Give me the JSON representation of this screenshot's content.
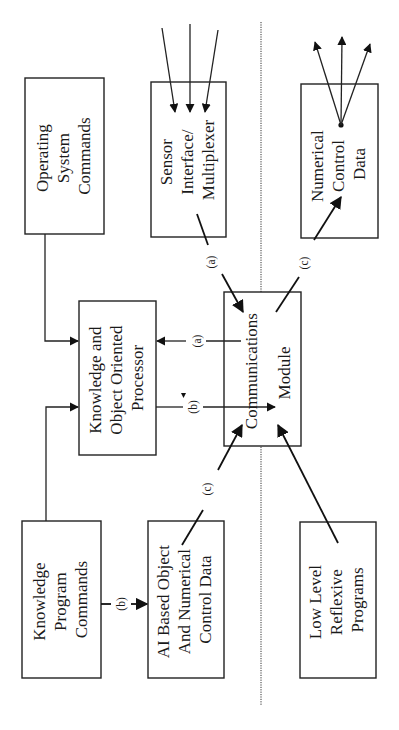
{
  "diagram": {
    "orientation": "rotated-90-ccw",
    "separator": "dotted-vertical-line",
    "boxes": {
      "operating_system": {
        "lines": [
          "Operating",
          "System",
          "Commands"
        ]
      },
      "sensor_interface": {
        "lines": [
          "Sensor",
          "Interface/",
          "Multiplexer"
        ]
      },
      "numerical_control": {
        "lines": [
          "Numerical",
          "Control",
          "Data"
        ]
      },
      "knowledge_processor": {
        "lines": [
          "Knowledge and",
          "Object Oriented",
          "Processor"
        ]
      },
      "communications": {
        "lines": [
          "Communications",
          "Module"
        ]
      },
      "knowledge_program": {
        "lines": [
          "Knowledge",
          "Program",
          "Commands"
        ]
      },
      "ai_based": {
        "lines": [
          "AI Based Object",
          "And Numerical",
          "Control Data"
        ]
      },
      "low_level": {
        "lines": [
          "Low Level",
          "Reflexive",
          "Programs"
        ]
      }
    },
    "connection_labels": {
      "sensor_to_comm": "(a)",
      "comm_to_processor": "(a)",
      "processor_to_comm": "(b)",
      "comm_to_numerical": "(c)",
      "ai_to_comm": "(c)",
      "program_to_ai": "(b)"
    }
  }
}
